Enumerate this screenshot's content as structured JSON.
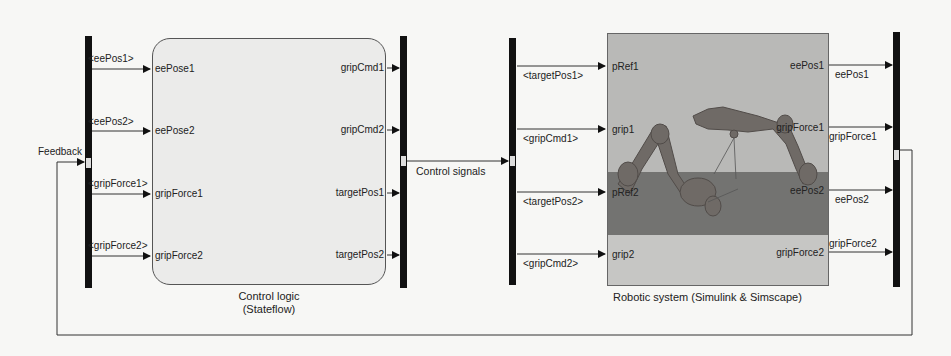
{
  "diagram": {
    "type": "simulink-model",
    "feedback_label": "Feedback",
    "control_signals_label": "Control signals",
    "control_logic": {
      "caption_line1": "Control logic",
      "caption_line2": "(Stateflow)",
      "inputs": [
        "eePose1",
        "eePose2",
        "gripForce1",
        "gripForce2"
      ],
      "outputs": [
        "gripCmd1",
        "gripCmd2",
        "targetPos1",
        "targetPos2"
      ],
      "input_signals": [
        "<eePos1>",
        "<eePos2>",
        "<gripForce1>",
        "<gripForce2>"
      ]
    },
    "robotic_system": {
      "caption": "Robotic system (Simulink & Simscape)",
      "inputs": [
        "pRef1",
        "grip1",
        "pRef2",
        "grip2"
      ],
      "outputs": [
        "eePos1",
        "gripForce1",
        "eePos2",
        "gripForce2"
      ],
      "input_signals": [
        "<targetPos1>",
        "<gripCmd1>",
        "<targetPos2>",
        "<gripCmd2>"
      ],
      "output_signals": [
        "eePos1",
        "gripForce1",
        "eePos2",
        "gripForce2"
      ]
    },
    "colors": {
      "bus": "#111111",
      "wire": "#333333",
      "stateflow_block_fill": "#ebebea",
      "robot_scene_sky": "#b9b9b7",
      "robot_scene_floor": "#737371",
      "robot_scene_base": "#c6c6c4"
    }
  }
}
